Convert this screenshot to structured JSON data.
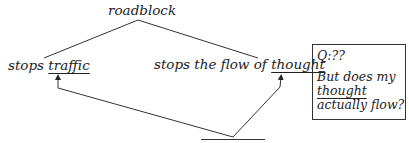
{
  "diagram": {
    "root": "roadblock",
    "left_branch": {
      "prefix": "stops ",
      "keyword": "traffic"
    },
    "right_branch": {
      "prefix": "stops the flow of ",
      "keyword": "thought"
    },
    "blank_node": ""
  },
  "note_box": {
    "q_label": "Q:??",
    "line1": "But does my",
    "line2": "thought",
    "line3_a": "actually",
    "line3_b": " flow?"
  },
  "colors": {
    "ink": "#222222",
    "background": "#ffffff"
  }
}
